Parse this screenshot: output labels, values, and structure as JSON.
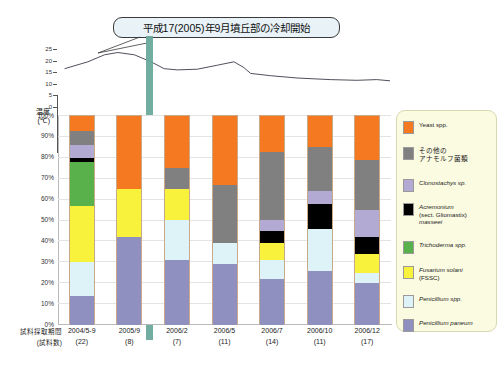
{
  "callout": {
    "text": "平成17(2005)年9月墳丘部の冷却開始"
  },
  "temperature_axis": {
    "label_line1": "温度",
    "label_line2": "(℃)",
    "ticks": [
      "25",
      "20",
      "15",
      "10",
      "5",
      "0"
    ]
  },
  "yaxis": {
    "ticks": [
      "100%",
      "90%",
      "80%",
      "70%",
      "60%",
      "50%",
      "40%",
      "30%",
      "20%",
      "10%",
      "0%"
    ]
  },
  "xaxis": {
    "title_line1": "試料採取期間",
    "title_line2": "(試料数)",
    "categories": [
      {
        "date": "2004/5-9",
        "count": "(22)"
      },
      {
        "date": "2005/9",
        "count": "(8)"
      },
      {
        "date": "2006/2",
        "count": "(7)"
      },
      {
        "date": "2006/5",
        "count": "(11)"
      },
      {
        "date": "2006/7",
        "count": "(14)"
      },
      {
        "date": "2006/10",
        "count": "(11)"
      },
      {
        "date": "2006/12",
        "count": "(17)"
      }
    ]
  },
  "legend": {
    "items": [
      {
        "name": "Yeast spp.",
        "color": "#f47920",
        "italic": false,
        "jp": false
      },
      {
        "name": "その他の\nアナモルフ菌類",
        "color": "#808080",
        "italic": false,
        "jp": true
      },
      {
        "name": "Clonostachys sp.",
        "color": "#b3aad4",
        "italic": true,
        "jp": false
      },
      {
        "name": "Acremonium\n(sect. Gliomastix)\nmasseei",
        "color": "#000000",
        "italic": true,
        "jp": false
      },
      {
        "name": "Trichoderma spp.",
        "color": "#59b14c",
        "italic": true,
        "jp": false
      },
      {
        "name": "Fusarium solani\n(FSSC)",
        "color": "#f9f23c",
        "italic": true,
        "jp": false
      },
      {
        "name": "Penicillium spp.",
        "color": "#ddf3f7",
        "italic": true,
        "jp": false
      },
      {
        "name": "Penicillium paneum",
        "color": "#8f8fc0",
        "italic": true,
        "jp": false
      }
    ]
  },
  "chart_data": {
    "type": "bar",
    "title": "",
    "xlabel": "試料採取期間 (試料数)",
    "ylabel": "",
    "ylim": [
      0,
      100
    ],
    "grid": true,
    "stacked": true,
    "legend_position": "right",
    "categories": [
      "2004/5-9",
      "2005/9",
      "2006/2",
      "2006/5",
      "2006/7",
      "2006/10",
      "2006/12"
    ],
    "sample_counts": [
      22,
      8,
      7,
      11,
      14,
      11,
      17
    ],
    "series": [
      {
        "name": "Penicillium paneum",
        "color": "#8f8fc0",
        "values": [
          14,
          42,
          31,
          29,
          22,
          26,
          20
        ]
      },
      {
        "name": "Penicillium spp.",
        "color": "#ddf3f7",
        "values": [
          16,
          0,
          19,
          10,
          9,
          20,
          5
        ]
      },
      {
        "name": "Fusarium solani (FSSC)",
        "color": "#f9f23c",
        "values": [
          27,
          23,
          15,
          0,
          8,
          0,
          9
        ]
      },
      {
        "name": "Trichoderma spp.",
        "color": "#59b14c",
        "values": [
          21,
          0,
          0,
          0,
          0,
          0,
          0
        ]
      },
      {
        "name": "Acremonium (sect. Gliomastix) masseei",
        "color": "#000000",
        "values": [
          2,
          0,
          0,
          0,
          6,
          12,
          8
        ]
      },
      {
        "name": "Clonostachys sp.",
        "color": "#b3aad4",
        "values": [
          6,
          0,
          0,
          0,
          5,
          6,
          13
        ]
      },
      {
        "name": "その他のアナモルフ菌類",
        "color": "#808080",
        "values": [
          7,
          0,
          10,
          28,
          33,
          21,
          24
        ]
      },
      {
        "name": "Yeast spp.",
        "color": "#f47920",
        "values": [
          7,
          35,
          25,
          33,
          17,
          15,
          21
        ]
      }
    ]
  },
  "temperature_series": {
    "name": "温度",
    "unit": "℃",
    "ylim": [
      0,
      25
    ],
    "points": [
      {
        "x": 0.02,
        "v": 16.5
      },
      {
        "x": 0.09,
        "v": 19.5
      },
      {
        "x": 0.14,
        "v": 22.5
      },
      {
        "x": 0.18,
        "v": 23.5
      },
      {
        "x": 0.23,
        "v": 22.5
      },
      {
        "x": 0.28,
        "v": 19.5
      },
      {
        "x": 0.32,
        "v": 16.5
      },
      {
        "x": 0.36,
        "v": 16.0
      },
      {
        "x": 0.42,
        "v": 16.3
      },
      {
        "x": 0.48,
        "v": 18.0
      },
      {
        "x": 0.53,
        "v": 19.5
      },
      {
        "x": 0.56,
        "v": 17.0
      },
      {
        "x": 0.58,
        "v": 14.5
      },
      {
        "x": 0.64,
        "v": 13.5
      },
      {
        "x": 0.72,
        "v": 12.5
      },
      {
        "x": 0.82,
        "v": 11.8
      },
      {
        "x": 0.9,
        "v": 11.5
      },
      {
        "x": 0.96,
        "v": 11.8
      },
      {
        "x": 1.0,
        "v": 11.3
      }
    ]
  },
  "cooling_marker": {
    "color": "#6aa99d"
  }
}
